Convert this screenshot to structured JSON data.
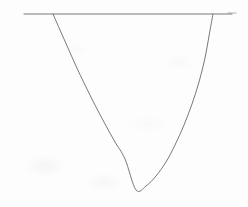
{
  "figure": {
    "background_color": "#fdfdfd",
    "ink_color": "#6a6a6a",
    "width": 248,
    "height": 207
  },
  "chart_data": {
    "type": "line",
    "title": "",
    "subtitle": "",
    "xlabel": "",
    "ylabel": "",
    "grid": false,
    "legend": null,
    "axis_visible": false,
    "tick_labels": [],
    "annotations": [],
    "xlim": [
      0,
      248
    ],
    "ylim": [
      207,
      0
    ],
    "series": [
      {
        "name": "parabola",
        "kind": "curve",
        "stroke": "#6a6a6a",
        "stroke_width": 0.9,
        "opens": "upward",
        "vertex": [
          136,
          190
        ],
        "x": [
          53,
          60,
          68,
          76,
          85,
          95,
          105,
          115,
          125,
          136,
          146,
          156,
          166,
          175,
          184,
          192,
          199,
          205,
          209,
          213
        ],
        "y": [
          14,
          30,
          48,
          66,
          85,
          105,
          124,
          142,
          159,
          190,
          186,
          176,
          162,
          145,
          125,
          104,
          82,
          58,
          36,
          14
        ]
      },
      {
        "name": "secant-line",
        "kind": "line",
        "stroke": "#6a6a6a",
        "stroke_width": 0.9,
        "x": [
          24,
          232
        ],
        "y": [
          14,
          14
        ]
      },
      {
        "name": "right-end-dash",
        "kind": "line",
        "stroke": "#9a9a9a",
        "stroke_width": 0.8,
        "x": [
          228,
          236
        ],
        "y": [
          13,
          13
        ]
      }
    ],
    "intersections": [
      {
        "name": "left-intersection",
        "x": 53,
        "y": 14
      },
      {
        "name": "right-intersection",
        "x": 213,
        "y": 14
      }
    ]
  }
}
